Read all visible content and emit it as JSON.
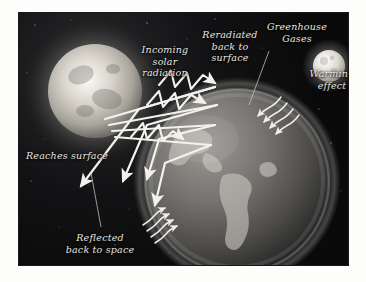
{
  "diagram": {
    "type": "illustration",
    "background_color": "#0a0a0b",
    "stroke_color": "#f2f0ea",
    "labels": {
      "incoming": "Incoming\nsolar\nradiation",
      "reradiated": "Reradiated\nback to\nsurface",
      "greenhouse": "Greenhouse\nGases",
      "warming": "Warming\neffect",
      "reaches": "Reaches surface",
      "reflected": "Reflected\nback to space"
    },
    "bodies": [
      {
        "name": "sun",
        "label": "Sun",
        "cx": 76,
        "cy": 78,
        "r": 47
      },
      {
        "name": "earth",
        "label": "Earth",
        "cx": 218,
        "cy": 168,
        "r": 92
      },
      {
        "name": "moon",
        "label": "Moon",
        "cx": 310,
        "cy": 53,
        "r": 16
      }
    ],
    "flows": [
      {
        "name": "incoming-solar-radiation",
        "direction": "sun-to-earth",
        "style": "straight-beam",
        "count": 4
      },
      {
        "name": "reradiated-back-to-surface",
        "direction": "atmosphere-to-surface",
        "style": "zigzag-arrow",
        "count": 3
      },
      {
        "name": "reaches-surface",
        "direction": "into-earth",
        "style": "arrow",
        "count": 2
      },
      {
        "name": "reflected-back-to-space",
        "direction": "earth-to-space",
        "style": "arrow",
        "count": 2
      },
      {
        "name": "warming-effect-right",
        "direction": "toward-surface",
        "style": "wavy-arrow",
        "count": 4
      },
      {
        "name": "warming-effect-bottom",
        "direction": "toward-surface",
        "style": "wavy-arrow",
        "count": 4
      }
    ]
  }
}
